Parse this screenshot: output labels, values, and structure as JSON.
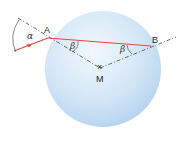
{
  "diagram": {
    "points": {
      "A": {
        "label": "A"
      },
      "B": {
        "label": "B"
      },
      "M": {
        "label": "M"
      }
    },
    "angles": {
      "alpha": "α",
      "beta_at_A": "β",
      "beta_at_B_1": "β",
      "beta_at_B_2": "β"
    },
    "colors": {
      "sphere_light": "#e9f3fb",
      "sphere_dark": "#b9d6ef",
      "ray": "#e8453c",
      "dash": "#444444"
    }
  }
}
